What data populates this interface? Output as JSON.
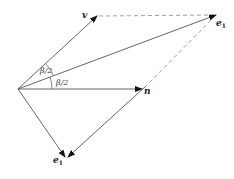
{
  "diagram": {
    "type": "vector-reflection",
    "colors": {
      "line": "#555555",
      "arrow": "#111111",
      "dashed": "#888888",
      "text": "#222222"
    },
    "origin": {
      "x": 18,
      "y": 89
    },
    "vectors": [
      {
        "name": "v",
        "label": "v",
        "from": [
          18,
          89
        ],
        "to": [
          97,
          16
        ],
        "style": "solid"
      },
      {
        "name": "e1-upper",
        "label": "e",
        "subscript": "1",
        "from": [
          18,
          89
        ],
        "to": [
          216,
          15
        ],
        "style": "solid"
      },
      {
        "name": "n",
        "label": "n",
        "from": [
          18,
          89
        ],
        "to": [
          142,
          89
        ],
        "style": "solid"
      },
      {
        "name": "e1-lower",
        "label": "e",
        "subscript": "1",
        "from": [
          18,
          89
        ],
        "to": [
          66,
          158
        ],
        "style": "solid"
      }
    ],
    "dashed_lines": [
      {
        "from": [
          97,
          16
        ],
        "to": [
          216,
          15
        ]
      },
      {
        "from": [
          216,
          15
        ],
        "to": [
          146,
          86
        ]
      }
    ],
    "connector": {
      "from": [
        146,
        86
      ],
      "to": [
        66,
        158
      ],
      "style": "solid"
    },
    "angles": [
      {
        "label": "β/2",
        "between": [
          "v",
          "e1-upper"
        ]
      },
      {
        "label": "β/2",
        "between": [
          "e1-upper",
          "n"
        ]
      }
    ],
    "labels": {
      "v": "v",
      "e1_upper": "e",
      "e1_upper_sub": "1",
      "n": "n",
      "e1_lower": "e",
      "e1_lower_sub": "1",
      "angle_upper": "β/2",
      "angle_lower": "β/2"
    }
  }
}
